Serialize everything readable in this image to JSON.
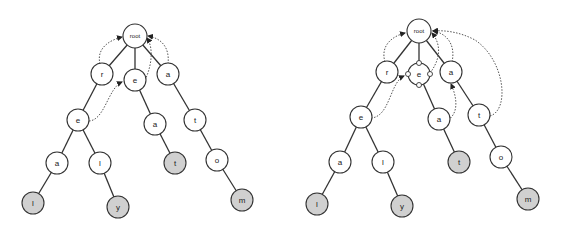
{
  "diagram": {
    "type": "trie-with-suffix-links",
    "colors": {
      "node_fill": "#ffffff",
      "terminal_fill": "#d0d0d0",
      "stroke": "#333333",
      "link": "#555555"
    },
    "left_tree": {
      "nodes": [
        {
          "id": "root",
          "label": "root"
        },
        {
          "id": "r",
          "label": "r"
        },
        {
          "id": "e1",
          "label": "e"
        },
        {
          "id": "a1",
          "label": "a"
        },
        {
          "id": "e2",
          "label": "e"
        },
        {
          "id": "a2",
          "label": "a"
        },
        {
          "id": "t1",
          "label": "t"
        },
        {
          "id": "a3",
          "label": "a"
        },
        {
          "id": "l1",
          "label": "l"
        },
        {
          "id": "t2",
          "label": "t",
          "terminal": true
        },
        {
          "id": "o",
          "label": "o"
        },
        {
          "id": "l2",
          "label": "l",
          "terminal": true
        },
        {
          "id": "y",
          "label": "y",
          "terminal": true
        },
        {
          "id": "m",
          "label": "m",
          "terminal": true
        }
      ],
      "words": [
        "real",
        "rely",
        "eat",
        "atom"
      ]
    },
    "right_tree": {
      "nodes": [
        {
          "id": "root",
          "label": "root"
        },
        {
          "id": "r",
          "label": "r"
        },
        {
          "id": "e1",
          "label": "e",
          "has_ports": true
        },
        {
          "id": "a1",
          "label": "a"
        },
        {
          "id": "e2",
          "label": "e"
        },
        {
          "id": "a2",
          "label": "a"
        },
        {
          "id": "t1",
          "label": "t"
        },
        {
          "id": "a3",
          "label": "a"
        },
        {
          "id": "l1",
          "label": "l"
        },
        {
          "id": "t2",
          "label": "t",
          "terminal": true
        },
        {
          "id": "o",
          "label": "o"
        },
        {
          "id": "l2",
          "label": "l",
          "terminal": true
        },
        {
          "id": "y",
          "label": "y",
          "terminal": true
        },
        {
          "id": "m",
          "label": "m",
          "terminal": true
        }
      ]
    }
  }
}
